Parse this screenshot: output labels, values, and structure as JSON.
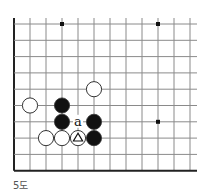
{
  "diagram": {
    "type": "go-board-fragment",
    "caption": "5도",
    "grid": {
      "columns": 12,
      "rows": 10,
      "origin_x": 14,
      "origin_y": 24,
      "spacing_x": 16,
      "spacing_y": 16.3,
      "right_edge_x": 197,
      "left_edge": "board-edge",
      "bottom_edge": "board-edge",
      "top_edge": "open",
      "right_edge": "open",
      "line_color": "#8a8a8a",
      "edge_color": "#222222"
    },
    "star_points": [
      {
        "col": 3,
        "row": 0
      },
      {
        "col": 9,
        "row": 0
      },
      {
        "col": 9,
        "row": 6
      }
    ],
    "stones": [
      {
        "color": "white",
        "col": 5,
        "row": 4
      },
      {
        "color": "white",
        "col": 1,
        "row": 5
      },
      {
        "color": "black",
        "col": 3,
        "row": 5
      },
      {
        "color": "black",
        "col": 3,
        "row": 6
      },
      {
        "color": "black",
        "col": 5,
        "row": 6
      },
      {
        "color": "white",
        "col": 2,
        "row": 7
      },
      {
        "color": "white",
        "col": 3,
        "row": 7
      },
      {
        "color": "white",
        "col": 4,
        "row": 7,
        "marker": "triangle"
      },
      {
        "color": "black",
        "col": 5,
        "row": 7
      }
    ],
    "labels": [
      {
        "text": "a",
        "col": 4,
        "row": 6
      }
    ],
    "colors": {
      "black_stone": "#111111",
      "white_stone": "#ffffff",
      "stone_outline": "#333333",
      "star_point": "#111111"
    }
  }
}
